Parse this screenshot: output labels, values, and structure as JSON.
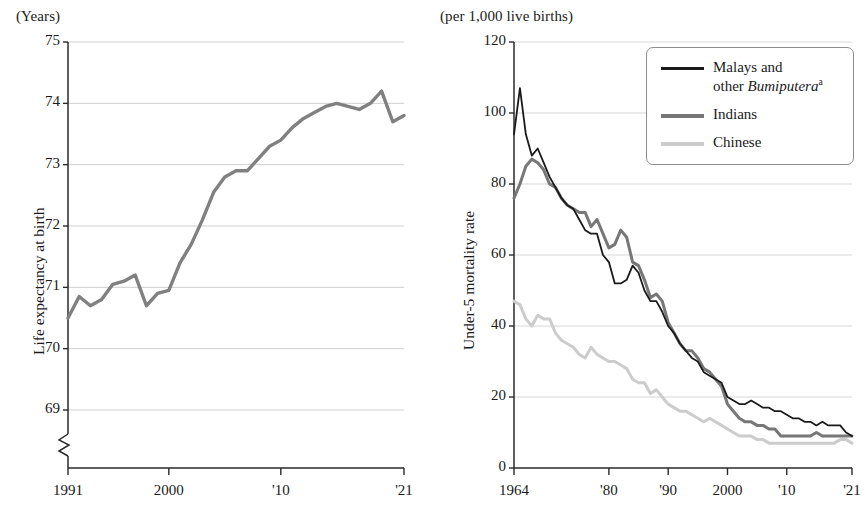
{
  "figure": {
    "panels": [
      {
        "id": "life-expectancy",
        "unit_label": "(Years)",
        "y_axis_title": "Life expectancy at birth",
        "has_axis_break": true,
        "y_ticks": [
          "69",
          "70",
          "71",
          "72",
          "73",
          "74",
          "75"
        ],
        "x_ticks": [
          "1991",
          "2000",
          "'10",
          "'21"
        ]
      },
      {
        "id": "under5-mortality",
        "unit_label": "(per 1,000 live births)",
        "y_axis_title": "Under-5 mortality rate",
        "has_axis_break": false,
        "y_ticks": [
          "0",
          "20",
          "40",
          "60",
          "80",
          "100",
          "120"
        ],
        "x_ticks": [
          "1964",
          "'80",
          "'90",
          "2000",
          "'10",
          "'21"
        ],
        "legend": {
          "items": [
            {
              "label": "Malays and\nother Bumiputera",
              "italic_part": "Bumiputera",
              "superscript": "a",
              "color": "#1a1a1a",
              "width": 2.6
            },
            {
              "label": "Indians",
              "italic_part": "",
              "superscript": "",
              "color": "#777777",
              "width": 4.2
            },
            {
              "label": "Chinese",
              "italic_part": "",
              "superscript": "",
              "color": "#cccccc",
              "width": 4.2
            }
          ]
        }
      }
    ]
  },
  "chart_data": [
    {
      "type": "line",
      "id": "life-expectancy",
      "title": "",
      "xlabel": "",
      "ylabel": "Life expectancy at birth",
      "unit": "(Years)",
      "xlim": [
        1991,
        2021
      ],
      "ylim": [
        68.55,
        75
      ],
      "ytick_values": [
        69,
        70,
        71,
        72,
        73,
        74,
        75
      ],
      "xtick_values": [
        1991,
        2000,
        2010,
        2021
      ],
      "xtick_labels": [
        "1991",
        "2000",
        "'10",
        "'21"
      ],
      "grid": "horizontal",
      "axis_break_below": 69,
      "legend_position": "none",
      "series": [
        {
          "name": "Life expectancy at birth",
          "color": "#808080",
          "x": [
            1991,
            1992,
            1993,
            1994,
            1995,
            1996,
            1997,
            1998,
            1999,
            2000,
            2001,
            2002,
            2003,
            2004,
            2005,
            2006,
            2007,
            2008,
            2009,
            2010,
            2011,
            2012,
            2013,
            2014,
            2015,
            2016,
            2017,
            2018,
            2019,
            2020,
            2021
          ],
          "values": [
            70.5,
            70.85,
            70.7,
            70.8,
            71.05,
            71.1,
            71.2,
            70.7,
            70.9,
            70.95,
            71.4,
            71.7,
            72.1,
            72.55,
            72.8,
            72.9,
            72.9,
            73.1,
            73.3,
            73.4,
            73.6,
            73.75,
            73.85,
            73.95,
            74.0,
            73.95,
            73.9,
            74.0,
            74.2,
            73.7,
            73.8
          ]
        }
      ]
    },
    {
      "type": "line",
      "id": "under5-mortality",
      "title": "",
      "xlabel": "",
      "ylabel": "Under-5 mortality rate",
      "unit": "(per 1,000 live births)",
      "xlim": [
        1964,
        2021
      ],
      "ylim": [
        0,
        120
      ],
      "ytick_values": [
        0,
        20,
        40,
        60,
        80,
        100,
        120
      ],
      "xtick_values": [
        1964,
        1980,
        1990,
        2000,
        2010,
        2021
      ],
      "xtick_labels": [
        "1964",
        "'80",
        "'90",
        "2000",
        "'10",
        "'21"
      ],
      "grid": "horizontal",
      "legend_position": "top-right",
      "series": [
        {
          "name": "Malays and other Bumiputera",
          "color": "#1a1a1a",
          "x": [
            1964,
            1965,
            1966,
            1967,
            1968,
            1969,
            1970,
            1971,
            1972,
            1973,
            1974,
            1975,
            1976,
            1977,
            1978,
            1979,
            1980,
            1981,
            1982,
            1983,
            1984,
            1985,
            1986,
            1987,
            1988,
            1989,
            1990,
            1991,
            1992,
            1993,
            1994,
            1995,
            1996,
            1997,
            1998,
            1999,
            2000,
            2001,
            2002,
            2003,
            2004,
            2005,
            2006,
            2007,
            2008,
            2009,
            2010,
            2011,
            2012,
            2013,
            2014,
            2015,
            2016,
            2017,
            2018,
            2019,
            2020,
            2021
          ],
          "values": [
            94,
            107,
            94,
            88,
            90,
            86,
            82,
            79,
            76,
            74,
            73,
            70,
            67,
            66,
            66,
            60,
            58,
            52,
            52,
            53,
            57,
            55,
            50,
            47,
            47,
            44,
            40,
            38,
            35,
            33,
            31,
            30,
            27,
            26,
            25,
            24,
            20,
            19,
            18,
            18,
            19,
            18,
            17,
            17,
            16,
            16,
            15,
            14,
            14,
            13,
            13,
            12,
            13,
            12,
            12,
            12,
            10,
            9
          ]
        },
        {
          "name": "Indians",
          "color": "#777777",
          "x": [
            1964,
            1965,
            1966,
            1967,
            1968,
            1969,
            1970,
            1971,
            1972,
            1973,
            1974,
            1975,
            1976,
            1977,
            1978,
            1979,
            1980,
            1981,
            1982,
            1983,
            1984,
            1985,
            1986,
            1987,
            1988,
            1989,
            1990,
            1991,
            1992,
            1993,
            1994,
            1995,
            1996,
            1997,
            1998,
            1999,
            2000,
            2001,
            2002,
            2003,
            2004,
            2005,
            2006,
            2007,
            2008,
            2009,
            2010,
            2011,
            2012,
            2013,
            2014,
            2015,
            2016,
            2017,
            2018,
            2019,
            2020,
            2021
          ],
          "values": [
            76,
            80,
            85,
            87,
            86,
            84,
            80,
            79,
            76,
            74,
            73,
            72,
            72,
            68,
            70,
            66,
            62,
            63,
            67,
            65,
            58,
            57,
            53,
            48,
            49,
            47,
            41,
            38,
            35,
            33,
            33,
            31,
            28,
            27,
            25,
            23,
            18,
            16,
            14,
            13,
            13,
            12,
            12,
            11,
            11,
            9,
            9,
            9,
            9,
            9,
            9,
            10,
            9,
            9,
            9,
            9,
            9,
            9
          ]
        },
        {
          "name": "Chinese",
          "color": "#cccccc",
          "x": [
            1964,
            1965,
            1966,
            1967,
            1968,
            1969,
            1970,
            1971,
            1972,
            1973,
            1974,
            1975,
            1976,
            1977,
            1978,
            1979,
            1980,
            1981,
            1982,
            1983,
            1984,
            1985,
            1986,
            1987,
            1988,
            1989,
            1990,
            1991,
            1992,
            1993,
            1994,
            1995,
            1996,
            1997,
            1998,
            1999,
            2000,
            2001,
            2002,
            2003,
            2004,
            2005,
            2006,
            2007,
            2008,
            2009,
            2010,
            2011,
            2012,
            2013,
            2014,
            2015,
            2016,
            2017,
            2018,
            2019,
            2020,
            2021
          ],
          "values": [
            47,
            46,
            42,
            40,
            43,
            42,
            42,
            38,
            36,
            35,
            34,
            32,
            31,
            34,
            32,
            31,
            30,
            30,
            29,
            28,
            25,
            24,
            24,
            21,
            22,
            20,
            18,
            17,
            16,
            16,
            15,
            14,
            13,
            14,
            13,
            12,
            11,
            10,
            9,
            9,
            9,
            8,
            8,
            7,
            7,
            7,
            7,
            7,
            7,
            7,
            7,
            7,
            7,
            7,
            7,
            8,
            8,
            7
          ]
        }
      ]
    }
  ]
}
